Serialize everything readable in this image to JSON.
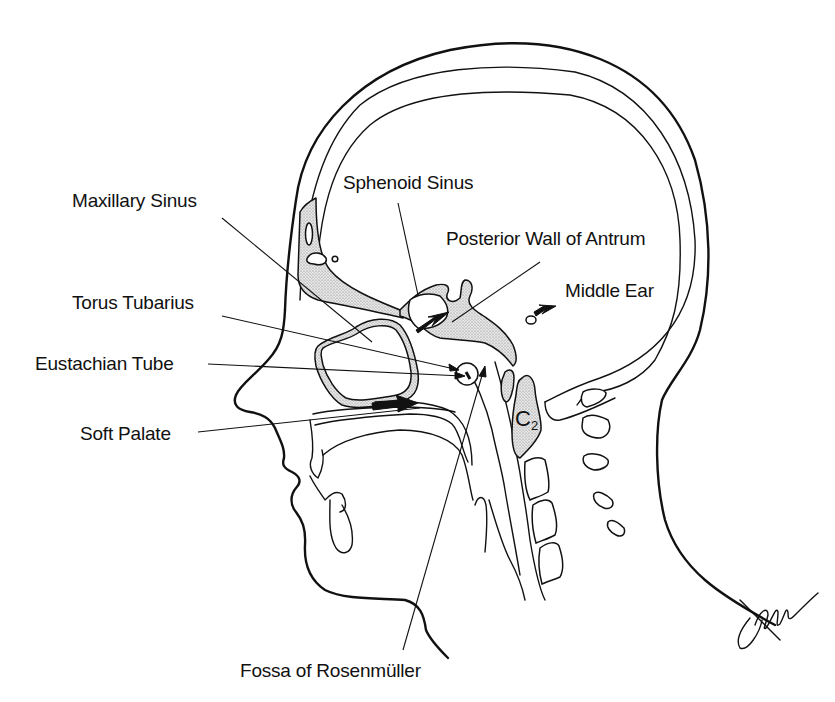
{
  "figure": {
    "background": "#ffffff",
    "ink_color": "#111111",
    "bone_fill": "stippled gray"
  },
  "labels": {
    "maxillary_sinus": "Maxillary Sinus",
    "sphenoid_sinus": "Sphenoid Sinus",
    "posterior_wall_of_antrum": "Posterior Wall of Antrum",
    "middle_ear": "Middle Ear",
    "torus_tubarius": "Torus Tubarius",
    "eustachian_tube": "Eustachian Tube",
    "soft_palate": "Soft Palate",
    "fossa_of_rosenmuller": "Fossa of Rosenmüller",
    "vertebra_letter": "C",
    "vertebra_number": "2"
  },
  "icons": {
    "bold_arrows": [
      "posterior-wall-arrow",
      "middle-ear-arrow",
      "soft-palate-arrow"
    ],
    "signature": "artist-signature"
  }
}
